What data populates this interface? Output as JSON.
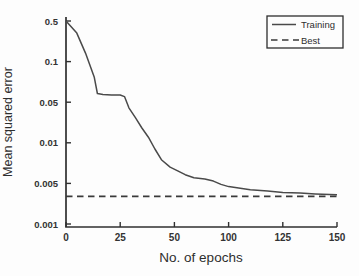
{
  "figure": {
    "background": "#fdfdfd",
    "axis_color": "#303030",
    "text_color": "#2e2e2e"
  },
  "legend": {
    "position": "top-right",
    "items": [
      {
        "label": "Training",
        "line_style": "solid",
        "color": "#4a4a4a"
      },
      {
        "label": "Best",
        "line_style": "dashed",
        "color": "#3a3a3a"
      }
    ]
  },
  "chart_data": {
    "type": "line",
    "title": "",
    "xlabel": "No. of epochs",
    "ylabel": "Mean squared error",
    "x_ticks": [
      0,
      25,
      50,
      100,
      125,
      150
    ],
    "y_ticks": [
      0.5,
      0.1,
      0.05,
      0.01,
      0.005,
      0.001
    ],
    "y_scale": "log-style axis with labeled ticks equally spaced",
    "grid": "off",
    "frame": "left-and-bottom-axes-only",
    "axis_color": "#303030",
    "line_color": "#4a4a4a",
    "dashed_color": "#3a3a3a",
    "series": [
      {
        "name": "Training",
        "style": "solid",
        "points": [
          [
            0,
            0.5
          ],
          [
            5,
            0.31
          ],
          [
            9,
            0.14
          ],
          [
            13,
            0.077
          ],
          [
            14.5,
            0.058
          ],
          [
            17,
            0.057
          ],
          [
            21,
            0.0565
          ],
          [
            25,
            0.0565
          ],
          [
            27,
            0.055
          ],
          [
            29,
            0.04
          ],
          [
            32,
            0.027
          ],
          [
            35,
            0.018
          ],
          [
            38,
            0.0125
          ],
          [
            41,
            0.009
          ],
          [
            44,
            0.0075
          ],
          [
            48,
            0.0066
          ],
          [
            53,
            0.0062
          ],
          [
            60,
            0.0058
          ],
          [
            68,
            0.0055
          ],
          [
            78,
            0.0054
          ],
          [
            86,
            0.0052
          ],
          [
            93,
            0.0048
          ],
          [
            100,
            0.0044
          ],
          [
            110,
            0.0039
          ],
          [
            118,
            0.0037
          ],
          [
            125,
            0.0035
          ],
          [
            133,
            0.0034
          ],
          [
            140,
            0.0033
          ],
          [
            150,
            0.0032
          ]
        ]
      },
      {
        "name": "Best",
        "style": "dashed",
        "points": [
          [
            0,
            0.003
          ],
          [
            150,
            0.003
          ]
        ]
      }
    ]
  }
}
